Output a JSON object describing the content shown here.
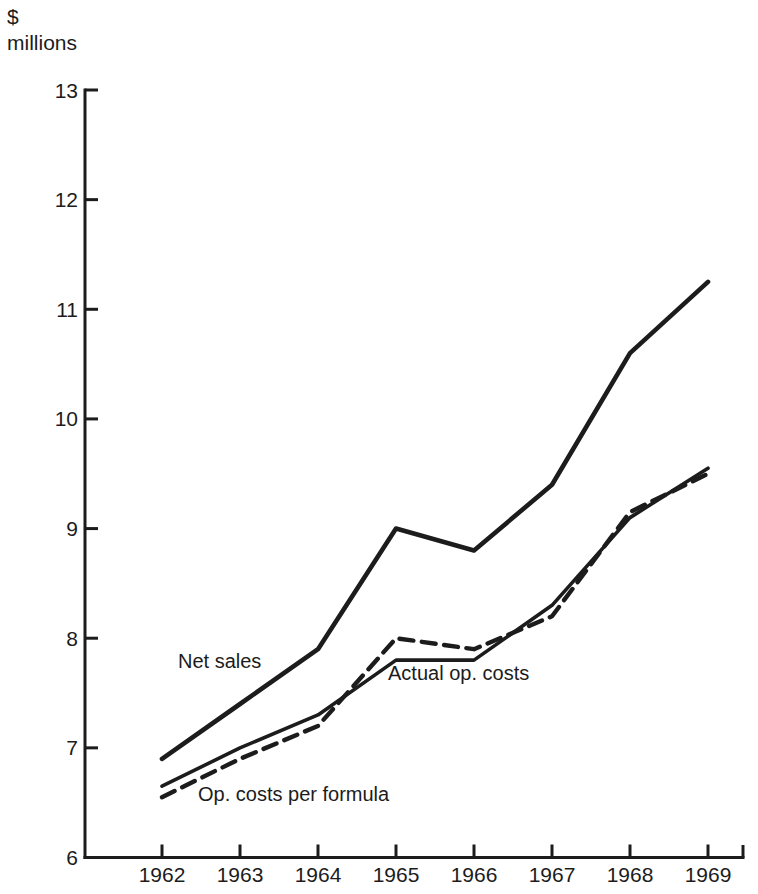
{
  "page": {
    "background": "#ffffff",
    "ink": "#1c1c1c"
  },
  "chart_data": {
    "type": "line",
    "title": "",
    "ylabel": "$ millions",
    "ylabel_lines": [
      "$",
      "millions"
    ],
    "xlabel": "",
    "categories": [
      "1962",
      "1963",
      "1964",
      "1965",
      "1966",
      "1967",
      "1968",
      "1969"
    ],
    "ylim": [
      6,
      13
    ],
    "yticks": [
      "13",
      "12",
      "11",
      "10",
      "9",
      "8",
      "7",
      "6"
    ],
    "ytick_values": [
      13,
      12,
      11,
      10,
      9,
      8,
      7,
      6
    ],
    "grid": false,
    "legend_position": "inline-annotations",
    "series": [
      {
        "name": "Net sales",
        "line_style": "solid-thick",
        "values": [
          6.9,
          7.4,
          7.9,
          9.0,
          8.8,
          9.4,
          10.6,
          11.25
        ]
      },
      {
        "name": "Actual op. costs",
        "line_style": "solid",
        "values": [
          6.65,
          7.0,
          7.3,
          7.8,
          7.8,
          8.3,
          9.1,
          9.55
        ]
      },
      {
        "name": "Op. costs per formula",
        "line_style": "dashed",
        "values": [
          6.55,
          6.9,
          7.2,
          8.0,
          7.9,
          8.2,
          9.15,
          9.5
        ]
      }
    ],
    "annotations": [
      {
        "text": "Net sales",
        "series": "Net sales"
      },
      {
        "text": "Actual op. costs",
        "series": "Actual op. costs"
      },
      {
        "text": "Op. costs per formula",
        "series": "Op. costs per formula"
      }
    ]
  }
}
